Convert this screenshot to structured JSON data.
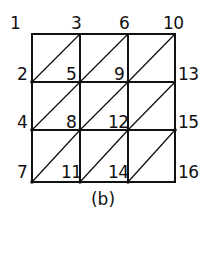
{
  "diagram": {
    "type": "triangulated-grid",
    "rows": 3,
    "cols": 3,
    "line_color": "#111111",
    "node_labels": [
      {
        "id": "n1",
        "text": "1",
        "x": 10,
        "y": 15
      },
      {
        "id": "n3",
        "text": "3",
        "x": 71,
        "y": 15
      },
      {
        "id": "n6",
        "text": "6",
        "x": 119,
        "y": 15
      },
      {
        "id": "n10",
        "text": "10",
        "x": 163,
        "y": 15
      },
      {
        "id": "n2",
        "text": "2",
        "x": 17,
        "y": 66
      },
      {
        "id": "n5",
        "text": "5",
        "x": 66,
        "y": 66
      },
      {
        "id": "n9",
        "text": "9",
        "x": 114,
        "y": 66
      },
      {
        "id": "n13",
        "text": "13",
        "x": 178,
        "y": 66
      },
      {
        "id": "n4",
        "text": "4",
        "x": 17,
        "y": 114
      },
      {
        "id": "n8",
        "text": "8",
        "x": 66,
        "y": 114
      },
      {
        "id": "n12",
        "text": "12",
        "x": 108,
        "y": 114
      },
      {
        "id": "n15",
        "text": "15",
        "x": 178,
        "y": 114
      },
      {
        "id": "n7",
        "text": "7",
        "x": 17,
        "y": 164
      },
      {
        "id": "n11",
        "text": "11",
        "x": 61,
        "y": 164
      },
      {
        "id": "n14",
        "text": "14",
        "x": 108,
        "y": 164
      },
      {
        "id": "n16",
        "text": "16",
        "x": 178,
        "y": 164
      }
    ],
    "caption": "(b)"
  }
}
